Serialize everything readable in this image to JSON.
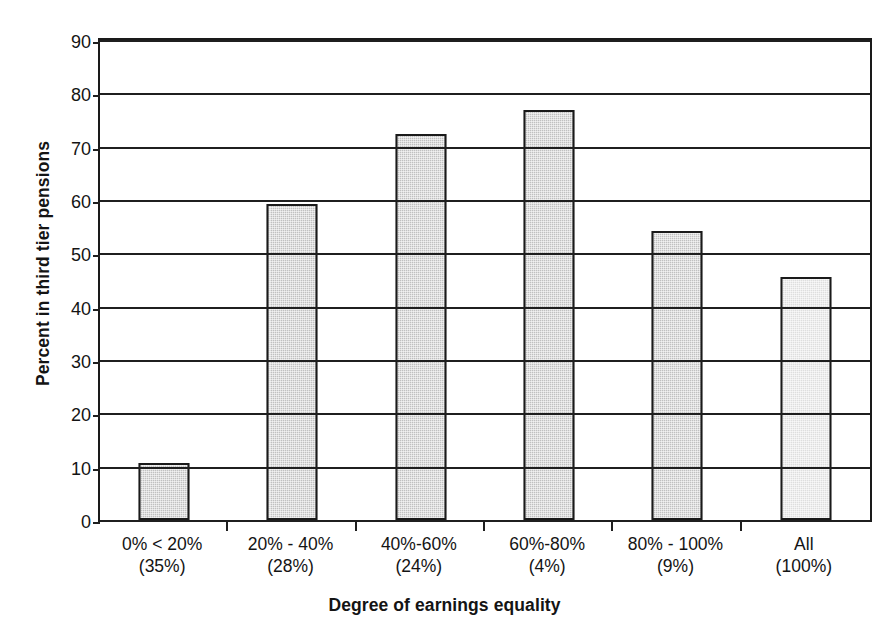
{
  "chart_data": {
    "type": "bar",
    "title": "",
    "xlabel": "Degree of earnings equality",
    "ylabel": "Percent in third tier pensions",
    "categories": [
      "0% < 20%",
      "20% - 40%",
      "40%-60%",
      "60%-80%",
      "80% - 100%",
      "All"
    ],
    "category_sublabels": [
      "(35%)",
      "(28%)",
      "(24%)",
      "(4%)",
      "(9%)",
      "(100%)"
    ],
    "values": [
      10.7,
      59.2,
      72.3,
      76.8,
      54.2,
      45.5
    ],
    "ylim": [
      0,
      90
    ],
    "ytick_labels": [
      "0",
      "10",
      "20",
      "30",
      "40",
      "50",
      "60",
      "70",
      "80",
      "90"
    ],
    "ytick_values": [
      0,
      10,
      20,
      30,
      40,
      50,
      60,
      70,
      80,
      90
    ],
    "grid": true,
    "legend": false,
    "bar_colors": [
      "#c0c0c0",
      "#c0c0c0",
      "#c0c0c0",
      "#c0c0c0",
      "#c0c0c0",
      "#dedede"
    ],
    "bar_border_color": "#1a1a1a",
    "axis_color": "#1f1f1f",
    "background_color": "#ffffff"
  }
}
